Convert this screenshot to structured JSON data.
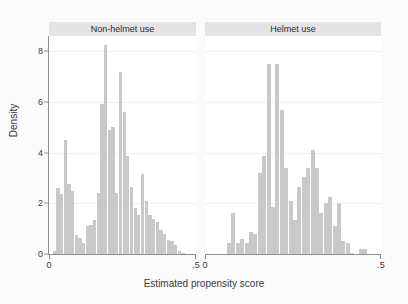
{
  "chart_data": {
    "type": "bar",
    "title": "",
    "subtitle": "",
    "xlabel": "Estimated propensity score",
    "ylabel": "Density",
    "grid": true,
    "legend": null,
    "xlim": [
      0,
      0.5
    ],
    "ylim": [
      0,
      8.6
    ],
    "xticks": [
      "0",
      ".5"
    ],
    "xtick_values": [
      0,
      0.5
    ],
    "yticks": [
      "0",
      "2",
      "4",
      "6",
      "8"
    ],
    "ytick_values": [
      0,
      2,
      4,
      6,
      8
    ],
    "bin_width": 0.0125,
    "panels": [
      {
        "label": "Non-helmet use",
        "x": [
          0.0188,
          0.0313,
          0.0438,
          0.0563,
          0.0688,
          0.0813,
          0.0938,
          0.1063,
          0.1188,
          0.1313,
          0.1438,
          0.1563,
          0.1688,
          0.1813,
          0.1938,
          0.2063,
          0.2188,
          0.2313,
          0.2438,
          0.2563,
          0.2688,
          0.2813,
          0.2938,
          0.3063,
          0.3188,
          0.3313,
          0.3438,
          0.3563,
          0.3688,
          0.3813,
          0.3938,
          0.4063,
          0.4188,
          0.4313,
          0.4438,
          0.4563
        ],
        "values": [
          0.1,
          2.6,
          2.35,
          4.5,
          2.75,
          2.5,
          0.75,
          0.65,
          0.45,
          1.1,
          1.15,
          1.35,
          2.4,
          5.9,
          8.25,
          4.9,
          5.0,
          2.4,
          7.2,
          5.6,
          3.85,
          2.65,
          1.8,
          1.55,
          3.15,
          2.1,
          1.55,
          1.4,
          1.25,
          0.95,
          0.8,
          0.55,
          0.5,
          0.35,
          0.1,
          0.05
        ]
      },
      {
        "label": "Helmet use",
        "x": [
          0.0688,
          0.0813,
          0.0938,
          0.1063,
          0.1188,
          0.1313,
          0.1438,
          0.1563,
          0.1688,
          0.1813,
          0.1938,
          0.2063,
          0.2188,
          0.2313,
          0.2438,
          0.2563,
          0.2688,
          0.2813,
          0.2938,
          0.3063,
          0.3188,
          0.3313,
          0.3438,
          0.3563,
          0.3688,
          0.3813,
          0.3938,
          0.4063,
          0.4188,
          0.4438,
          0.4563
        ],
        "values": [
          0.45,
          1.6,
          0.45,
          0.6,
          0.45,
          0.85,
          0.8,
          3.2,
          3.85,
          7.5,
          1.85,
          7.5,
          5.7,
          3.4,
          2.1,
          1.35,
          2.65,
          3.05,
          3.4,
          4.1,
          3.4,
          1.6,
          2.0,
          2.25,
          1.1,
          2.0,
          0.5,
          0.45,
          0.05,
          0.2,
          0.2
        ]
      }
    ],
    "colors": {
      "bar": "#c9c9c9",
      "panel_header": "#e4e4e4",
      "axis": "#8f8f8f",
      "grid": "#f1f1f1",
      "plot_background": "#ffffff",
      "figure_background": "#fbfbfb",
      "text": "#3a3a3a"
    }
  }
}
